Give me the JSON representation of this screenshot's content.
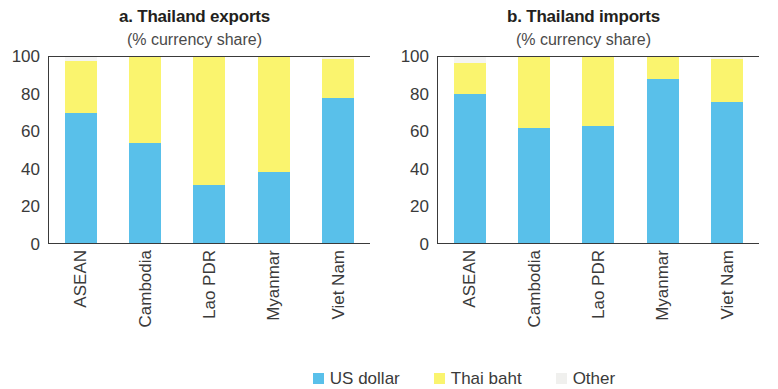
{
  "figure": {
    "panels": [
      {
        "id": "exports",
        "title": "a. Thailand exports",
        "subtitle": "(% currency share)"
      },
      {
        "id": "imports",
        "title": "b. Thailand imports",
        "subtitle": "(% currency share)"
      }
    ],
    "y_ticks": [
      "100",
      "80",
      "60",
      "40",
      "20",
      "0"
    ],
    "legend": [
      {
        "label": "US dollar",
        "color": "#59c0ea"
      },
      {
        "label": "Thai baht",
        "color": "#faf46e"
      },
      {
        "label": "Other",
        "color": "#f0f0ee"
      }
    ]
  },
  "chart_data": [
    {
      "type": "bar",
      "stacked": true,
      "title": "a. Thailand exports",
      "subtitle": "(% currency share)",
      "xlabel": "",
      "ylabel": "% currency share",
      "ylim": [
        0,
        100
      ],
      "yticks": [
        0,
        20,
        40,
        60,
        80,
        100
      ],
      "grid": false,
      "legend_position": "bottom",
      "categories": [
        "ASEAN",
        "Cambodia",
        "Lao PDR",
        "Myanmar",
        "Viet Nam"
      ],
      "series": [
        {
          "name": "US dollar",
          "color": "#59c0ea",
          "values": [
            70,
            54,
            31,
            38,
            78
          ]
        },
        {
          "name": "Thai baht",
          "color": "#faf46e",
          "values": [
            28,
            46,
            69,
            62,
            21
          ]
        },
        {
          "name": "Other",
          "color": "#f0f0ee",
          "values": [
            2,
            0,
            0,
            0,
            1
          ]
        }
      ]
    },
    {
      "type": "bar",
      "stacked": true,
      "title": "b. Thailand imports",
      "subtitle": "(% currency share)",
      "xlabel": "",
      "ylabel": "% currency share",
      "ylim": [
        0,
        100
      ],
      "yticks": [
        0,
        20,
        40,
        60,
        80,
        100
      ],
      "grid": false,
      "legend_position": "bottom",
      "categories": [
        "ASEAN",
        "Cambodia",
        "Lao PDR",
        "Myanmar",
        "Viet Nam"
      ],
      "series": [
        {
          "name": "US dollar",
          "color": "#59c0ea",
          "values": [
            80,
            62,
            63,
            88,
            76
          ]
        },
        {
          "name": "Thai baht",
          "color": "#faf46e",
          "values": [
            17,
            38,
            37,
            12,
            23
          ]
        },
        {
          "name": "Other",
          "color": "#f0f0ee",
          "values": [
            3,
            0,
            0,
            0,
            1
          ]
        }
      ]
    }
  ]
}
